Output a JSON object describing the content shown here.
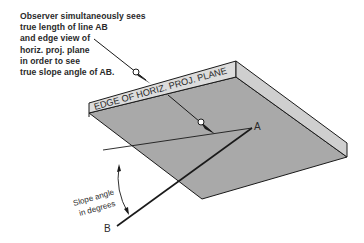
{
  "diagram": {
    "type": "descriptive-geometry-illustration",
    "annotation": {
      "lines": [
        "Observer simultaneously sees",
        "true length of line AB",
        "and edge view of",
        "horiz. proj. plane",
        "in order to see",
        "true slope angle of AB."
      ]
    },
    "plane_edge_label": "EDGE OF HORIZ. PROJ. PLANE",
    "point_a_label": "A",
    "point_b_label": "B",
    "angle_label_line1": "Slope angle",
    "angle_label_line2": "in degrees",
    "colors": {
      "plane_top": "#a8a8a8",
      "plane_edge": "#d9d9d9",
      "plane_side": "#c4c4c4",
      "lines": "#1a1a1a"
    }
  }
}
